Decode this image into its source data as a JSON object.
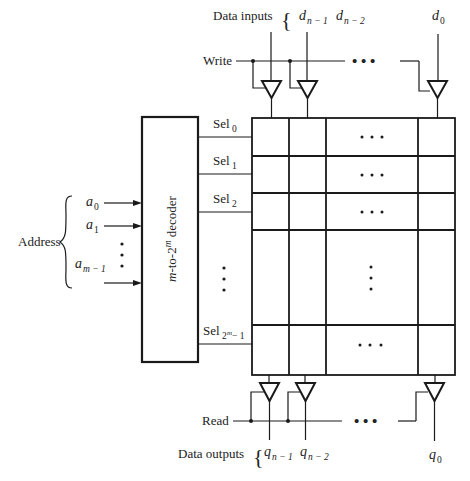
{
  "top": {
    "data_inputs_label": "Data inputs",
    "brace": "{",
    "write_label": "Write",
    "inputs": [
      {
        "base": "d",
        "sub": "n − 1"
      },
      {
        "base": "d",
        "sub": "n − 2"
      },
      {
        "base": "d",
        "sub": "0"
      }
    ],
    "ellipsis": "• • •"
  },
  "decoder": {
    "label_m": "m",
    "label_mid": "-to-2",
    "label_sup": "m",
    "label_end": " decoder"
  },
  "address": {
    "label": "Address",
    "brace": "{",
    "lines": [
      {
        "base": "a",
        "sub": "0"
      },
      {
        "base": "a",
        "sub": "1"
      },
      {
        "base": "a",
        "sub": "m − 1"
      }
    ],
    "vdots": "⋮"
  },
  "selects": [
    {
      "base": "Sel",
      "sub": "0"
    },
    {
      "base": "Sel",
      "sub": "1"
    },
    {
      "base": "Sel",
      "sub": "2"
    },
    {
      "base": "Sel",
      "sub": "2",
      "sup": "m",
      "tail": " − 1"
    }
  ],
  "grid": {
    "row_ellipsis": "• • •",
    "col_ellipsis": "⋮"
  },
  "bottom": {
    "data_outputs_label": "Data outputs",
    "brace": "{",
    "read_label": "Read",
    "outputs": [
      {
        "base": "q",
        "sub": "n − 1"
      },
      {
        "base": "q",
        "sub": "n − 2"
      },
      {
        "base": "q",
        "sub": "0"
      }
    ],
    "ellipsis": "• • •"
  }
}
